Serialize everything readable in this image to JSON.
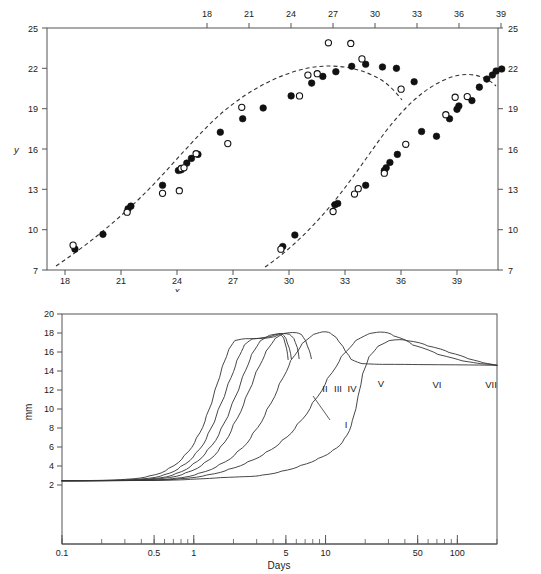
{
  "page": {
    "width": 541,
    "height": 574,
    "background": "#ffffff",
    "header_faint_text": ""
  },
  "colors": {
    "axis": "#555555",
    "ink": "#111111",
    "curve": "#333333",
    "background": "#ffffff"
  },
  "chart_data": [
    {
      "id": "top-chart",
      "type": "scatter",
      "title": "",
      "xlabel": "x",
      "ylabel": "y",
      "xlim": [
        17.0,
        41.2
      ],
      "ylim": [
        7,
        25
      ],
      "grid": false,
      "legend": "none",
      "axes": {
        "bottom": {
          "name": "x-axis-bottom",
          "ticks": [
            18,
            21,
            24,
            27,
            30,
            33,
            36,
            39
          ],
          "label": "x",
          "range": [
            17.0,
            41.2
          ]
        },
        "top": {
          "name": "x-axis-top",
          "ticks": [
            18,
            21,
            24,
            27,
            30,
            33,
            36,
            39
          ],
          "label": "",
          "range": [
            9.97,
            42.2
          ],
          "note": "offset secondary scale"
        },
        "left": {
          "name": "y-axis-left",
          "ticks": [
            7,
            10,
            13,
            16,
            19,
            22,
            25
          ],
          "label": "y",
          "range": [
            7,
            25
          ]
        },
        "right": {
          "name": "y-axis-right",
          "ticks": [
            7,
            10,
            13,
            16,
            19,
            22,
            25
          ],
          "label": "",
          "range": [
            7,
            25
          ]
        }
      },
      "series": [
        {
          "name": "Series A fitted (filled circles)",
          "marker": "filled-circle",
          "axis": "bottom",
          "points": [
            [
              18.5,
              8.55
            ],
            [
              20.0,
              9.65
            ],
            [
              21.35,
              11.55
            ],
            [
              21.5,
              11.75
            ],
            [
              23.2,
              13.3
            ],
            [
              24.05,
              14.4
            ],
            [
              24.2,
              14.45
            ],
            [
              24.5,
              14.95
            ],
            [
              24.75,
              15.3
            ],
            [
              25.1,
              15.6
            ],
            [
              26.3,
              17.25
            ],
            [
              27.5,
              18.25
            ],
            [
              28.6,
              19.05
            ],
            [
              30.1,
              19.95
            ],
            [
              31.2,
              20.9
            ],
            [
              31.8,
              21.4
            ],
            [
              32.5,
              21.75
            ],
            [
              33.35,
              22.15
            ],
            [
              34.1,
              22.3
            ],
            [
              35.0,
              22.1
            ],
            [
              35.75,
              22.0
            ],
            [
              36.7,
              21.0
            ]
          ]
        },
        {
          "name": "Series A observed (open circles)",
          "marker": "open-circle",
          "axis": "bottom",
          "points": [
            [
              18.4,
              8.85
            ],
            [
              21.3,
              11.3
            ],
            [
              23.2,
              12.7
            ],
            [
              24.1,
              12.9
            ],
            [
              24.2,
              14.55
            ],
            [
              24.35,
              14.6
            ],
            [
              25.0,
              15.65
            ],
            [
              26.7,
              16.4
            ],
            [
              27.45,
              19.1
            ],
            [
              30.55,
              19.95
            ],
            [
              31.0,
              21.5
            ],
            [
              31.5,
              21.6
            ],
            [
              32.1,
              23.9
            ],
            [
              33.3,
              23.85
            ],
            [
              33.9,
              22.7
            ],
            [
              36.0,
              20.45
            ]
          ]
        },
        {
          "name": "Series B fitted (filled circles)",
          "marker": "filled-circle",
          "axis": "bottom",
          "points": [
            [
              29.65,
              8.75
            ],
            [
              30.3,
              9.6
            ],
            [
              32.45,
              11.85
            ],
            [
              32.6,
              11.95
            ],
            [
              34.1,
              13.3
            ],
            [
              35.1,
              14.4
            ],
            [
              35.2,
              14.6
            ],
            [
              35.4,
              15.0
            ],
            [
              35.8,
              15.6
            ],
            [
              37.1,
              17.3
            ],
            [
              37.9,
              16.95
            ],
            [
              38.6,
              18.25
            ],
            [
              39.1,
              19.2
            ],
            [
              39.0,
              18.95
            ],
            [
              39.8,
              19.6
            ],
            [
              40.2,
              20.6
            ],
            [
              40.6,
              21.2
            ],
            [
              40.9,
              21.5
            ],
            [
              41.1,
              21.8
            ],
            [
              41.4,
              21.95
            ]
          ]
        },
        {
          "name": "Series B observed (open circles)",
          "marker": "open-circle",
          "axis": "bottom",
          "points": [
            [
              29.55,
              8.55
            ],
            [
              32.35,
              11.35
            ],
            [
              33.5,
              12.65
            ],
            [
              33.7,
              13.05
            ],
            [
              35.1,
              14.2
            ],
            [
              36.25,
              16.35
            ],
            [
              38.4,
              18.55
            ],
            [
              38.9,
              19.85
            ],
            [
              39.55,
              19.9
            ]
          ]
        }
      ],
      "fit_curves": [
        {
          "name": "fit-curve-left",
          "style": "dashed"
        },
        {
          "name": "fit-curve-right",
          "style": "dashed"
        }
      ]
    },
    {
      "id": "bottom-chart",
      "type": "line",
      "title": "",
      "xlabel": "Days",
      "ylabel": "mm",
      "xscale": "log",
      "xlim": [
        0.1,
        200
      ],
      "ylim": [
        0,
        20
      ],
      "grid": false,
      "legend": "inline curve labels",
      "axes": {
        "x": {
          "name": "x-axis-days",
          "ticks": [
            0.1,
            0.5,
            1,
            5,
            10,
            50,
            100
          ],
          "tick_labels": [
            "0.1",
            "0.5",
            "1",
            "5",
            "10",
            "50",
            "100"
          ],
          "label": "Days",
          "scale": "log"
        },
        "y": {
          "name": "y-axis-mm",
          "ticks": [
            2,
            4,
            6,
            8,
            10,
            12,
            14,
            16,
            18,
            20
          ],
          "label": "mm",
          "range": [
            0,
            20
          ]
        }
      },
      "curve_labels": [
        "I",
        "II",
        "III",
        "IV",
        "V",
        "VI",
        "VII"
      ],
      "series": [
        {
          "name": "I",
          "points": [
            [
              0.1,
              2.45
            ],
            [
              0.2,
              2.5
            ],
            [
              0.35,
              2.7
            ],
            [
              0.5,
              3.2
            ],
            [
              0.7,
              4.3
            ],
            [
              0.9,
              5.9
            ],
            [
              1.1,
              8.0
            ],
            [
              1.3,
              10.6
            ],
            [
              1.5,
              13.4
            ],
            [
              1.7,
              15.6
            ],
            [
              1.9,
              17.0
            ],
            [
              2.1,
              17.4
            ],
            [
              2.6,
              17.4
            ],
            [
              3.3,
              17.45
            ],
            [
              4.0,
              17.6
            ],
            [
              4.4,
              17.9
            ],
            [
              4.7,
              17.6
            ],
            [
              5.0,
              16.3
            ],
            [
              5.2,
              15.2
            ]
          ]
        },
        {
          "name": "II",
          "points": [
            [
              0.1,
              2.45
            ],
            [
              0.25,
              2.5
            ],
            [
              0.45,
              2.75
            ],
            [
              0.65,
              3.4
            ],
            [
              0.85,
              4.5
            ],
            [
              1.1,
              6.2
            ],
            [
              1.35,
              8.6
            ],
            [
              1.6,
              11.3
            ],
            [
              1.9,
              14.0
            ],
            [
              2.2,
              16.2
            ],
            [
              2.5,
              17.3
            ],
            [
              2.9,
              17.45
            ],
            [
              3.6,
              17.6
            ],
            [
              4.2,
              17.9
            ],
            [
              4.6,
              17.95
            ],
            [
              4.9,
              17.5
            ],
            [
              5.2,
              16.4
            ],
            [
              5.5,
              15.3
            ]
          ]
        },
        {
          "name": "III",
          "points": [
            [
              0.1,
              2.45
            ],
            [
              0.3,
              2.5
            ],
            [
              0.55,
              2.8
            ],
            [
              0.8,
              3.6
            ],
            [
              1.05,
              4.8
            ],
            [
              1.35,
              6.6
            ],
            [
              1.7,
              9.2
            ],
            [
              2.05,
              12.0
            ],
            [
              2.45,
              14.8
            ],
            [
              2.85,
              16.7
            ],
            [
              3.3,
              17.6
            ],
            [
              3.9,
              17.9
            ],
            [
              4.6,
              17.95
            ],
            [
              5.2,
              17.9
            ],
            [
              5.6,
              17.5
            ],
            [
              6.0,
              16.5
            ],
            [
              6.3,
              15.3
            ]
          ]
        },
        {
          "name": "IV",
          "points": [
            [
              0.1,
              2.45
            ],
            [
              0.35,
              2.5
            ],
            [
              0.65,
              2.85
            ],
            [
              0.95,
              3.7
            ],
            [
              1.3,
              5.0
            ],
            [
              1.7,
              7.0
            ],
            [
              2.1,
              9.7
            ],
            [
              2.6,
              12.6
            ],
            [
              3.1,
              15.2
            ],
            [
              3.7,
              17.0
            ],
            [
              4.3,
              17.85
            ],
            [
              5.0,
              18.05
            ],
            [
              5.8,
              18.05
            ],
            [
              6.4,
              17.9
            ],
            [
              6.9,
              17.2
            ],
            [
              7.4,
              16.1
            ],
            [
              7.8,
              15.3
            ]
          ]
        },
        {
          "name": "V",
          "points": [
            [
              0.1,
              2.45
            ],
            [
              0.45,
              2.5
            ],
            [
              0.8,
              2.85
            ],
            [
              1.2,
              3.6
            ],
            [
              1.7,
              4.7
            ],
            [
              2.3,
              6.3
            ],
            [
              3.0,
              8.6
            ],
            [
              3.8,
              11.3
            ],
            [
              4.7,
              14.0
            ],
            [
              5.7,
              16.2
            ],
            [
              7.0,
              17.6
            ],
            [
              8.5,
              18.1
            ],
            [
              10.0,
              18.15
            ],
            [
              11.5,
              17.6
            ],
            [
              13.0,
              16.6
            ],
            [
              14.5,
              15.6
            ],
            [
              16.0,
              14.85
            ],
            [
              20.0,
              14.7
            ],
            [
              30.0,
              14.7
            ],
            [
              60.0,
              14.65
            ],
            [
              200.0,
              14.6
            ]
          ]
        },
        {
          "name": "VI",
          "points": [
            [
              0.1,
              2.45
            ],
            [
              0.5,
              2.5
            ],
            [
              0.9,
              2.8
            ],
            [
              1.4,
              3.3
            ],
            [
              2.0,
              4.0
            ],
            [
              2.8,
              4.9
            ],
            [
              3.8,
              6.0
            ],
            [
              5.0,
              7.4
            ],
            [
              6.5,
              9.4
            ],
            [
              8.5,
              11.9
            ],
            [
              11.0,
              14.5
            ],
            [
              14.0,
              16.6
            ],
            [
              18.0,
              17.8
            ],
            [
              23.0,
              18.1
            ],
            [
              27.0,
              18.1
            ],
            [
              35.0,
              17.3
            ],
            [
              50.0,
              16.2
            ],
            [
              80.0,
              15.3
            ],
            [
              120.0,
              14.85
            ],
            [
              160.0,
              14.7
            ],
            [
              200.0,
              14.6
            ]
          ]
        },
        {
          "name": "VII",
          "points": [
            [
              0.1,
              2.45
            ],
            [
              0.6,
              2.5
            ],
            [
              1.1,
              2.7
            ],
            [
              1.8,
              2.85
            ],
            [
              2.6,
              2.9
            ],
            [
              3.6,
              3.2
            ],
            [
              5.0,
              3.7
            ],
            [
              7.0,
              4.4
            ],
            [
              9.5,
              5.2
            ],
            [
              12.0,
              6.1
            ],
            [
              14.5,
              7.6
            ],
            [
              16.5,
              10.0
            ],
            [
              18.0,
              12.6
            ],
            [
              19.5,
              14.8
            ],
            [
              22.0,
              16.2
            ],
            [
              26.0,
              17.0
            ],
            [
              32.0,
              17.4
            ],
            [
              45.0,
              17.0
            ],
            [
              65.0,
              16.3
            ],
            [
              95.0,
              15.6
            ],
            [
              130.0,
              15.0
            ],
            [
              170.0,
              14.7
            ],
            [
              200.0,
              14.6
            ]
          ]
        }
      ]
    }
  ]
}
